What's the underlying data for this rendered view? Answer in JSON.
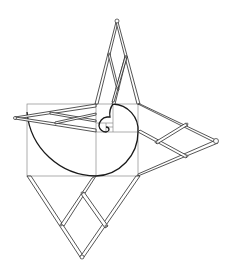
{
  "figure": {
    "colors": {
      "background": "#ffffff",
      "spiral": "#1a1a1a",
      "grid": "#8a8a8a",
      "linkage": "#2a2a2a"
    }
  }
}
